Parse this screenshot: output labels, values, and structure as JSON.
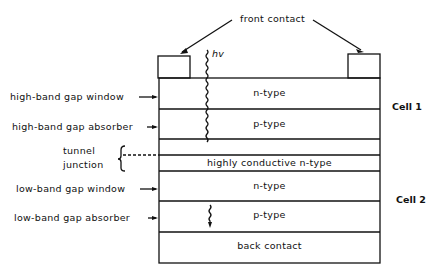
{
  "diagram": {
    "title_label": "front contact",
    "photon_label": "hv",
    "layers": [
      {
        "id": "n-type-top",
        "text": "n-type"
      },
      {
        "id": "p-type-top",
        "text": "p-type"
      },
      {
        "id": "tunnel-upper",
        "text": ""
      },
      {
        "id": "highly-conductive",
        "text": "highly conductive n-type"
      },
      {
        "id": "n-type-bottom",
        "text": "n-type"
      },
      {
        "id": "p-type-bottom",
        "text": "p-type"
      },
      {
        "id": "back-contact",
        "text": "back contact"
      }
    ],
    "left_labels": {
      "high_window": "high-band gap window",
      "high_absorber": "high-band gap absorber",
      "tunnel_1": "tunnel",
      "tunnel_2": "junction",
      "low_window": "low-band gap window",
      "low_absorber": "low-band gap absorber"
    },
    "right_labels": {
      "cell1": "Cell 1",
      "cell2": "Cell 2"
    }
  }
}
